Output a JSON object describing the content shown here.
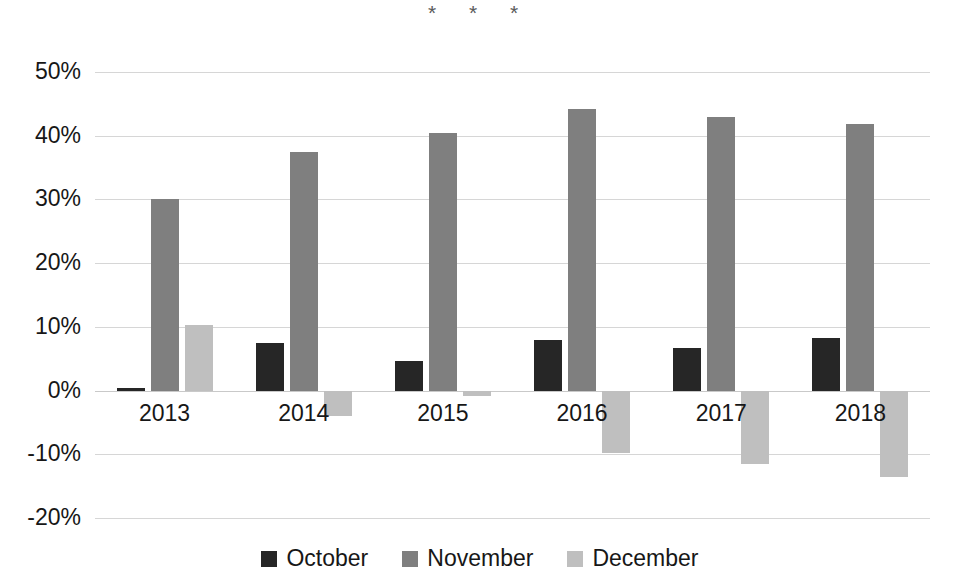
{
  "chart_data": {
    "type": "bar",
    "title": "",
    "subtitle": "",
    "xlabel": "",
    "ylabel": "",
    "categories": [
      "2013",
      "2014",
      "2015",
      "2016",
      "2017",
      "2018"
    ],
    "series": [
      {
        "name": "October",
        "color": "#262626",
        "values": [
          0.4,
          7.5,
          4.7,
          7.9,
          6.7,
          8.2
        ]
      },
      {
        "name": "November",
        "color": "#7f7f7f",
        "values": [
          30.0,
          37.5,
          40.4,
          44.2,
          43.0,
          41.9
        ]
      },
      {
        "name": "December",
        "color": "#bfbfbf",
        "values": [
          10.3,
          -4.0,
          -0.8,
          -9.8,
          -11.5,
          -13.6
        ]
      }
    ],
    "ylim": [
      -20,
      50
    ],
    "y_ticks": [
      50,
      40,
      30,
      20,
      10,
      0,
      -10,
      -20
    ],
    "y_tick_labels": [
      "50%",
      "40%",
      "30%",
      "20%",
      "10%",
      "0%",
      "-10%",
      "-20%"
    ],
    "grid": true,
    "grid_axis": "y",
    "legend_position": "bottom",
    "value_unit": "percent",
    "annotations": [
      {
        "text": "*",
        "x_px": 432,
        "y_px": 2
      },
      {
        "text": "*",
        "x_px": 473,
        "y_px": 2
      },
      {
        "text": "*",
        "x_px": 514,
        "y_px": 2
      }
    ]
  },
  "legend": {
    "items": [
      {
        "label": "October",
        "color": "#262626"
      },
      {
        "label": "November",
        "color": "#7f7f7f"
      },
      {
        "label": "December",
        "color": "#bfbfbf"
      }
    ]
  }
}
